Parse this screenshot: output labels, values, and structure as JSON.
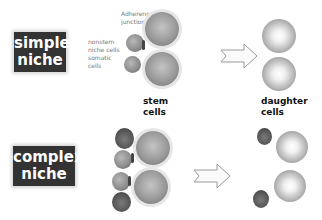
{
  "rows": [
    {
      "label": [
        "simple",
        "niche"
      ],
      "annotations": {
        "adherence": [
          "Adherence",
          "junction"
        ],
        "nonstem": [
          "nonstem",
          "niche cells",
          "somatic",
          "cells"
        ]
      },
      "stem_caption": [
        "stem",
        "cells"
      ],
      "daughter_caption": [
        "daughter",
        "cells"
      ]
    },
    {
      "label": [
        "complex",
        "niche"
      ]
    }
  ],
  "colors": {
    "label_bg": "#333333",
    "label_text": "#ffffff"
  },
  "icons": {
    "arrow": "outline-right-arrow"
  }
}
